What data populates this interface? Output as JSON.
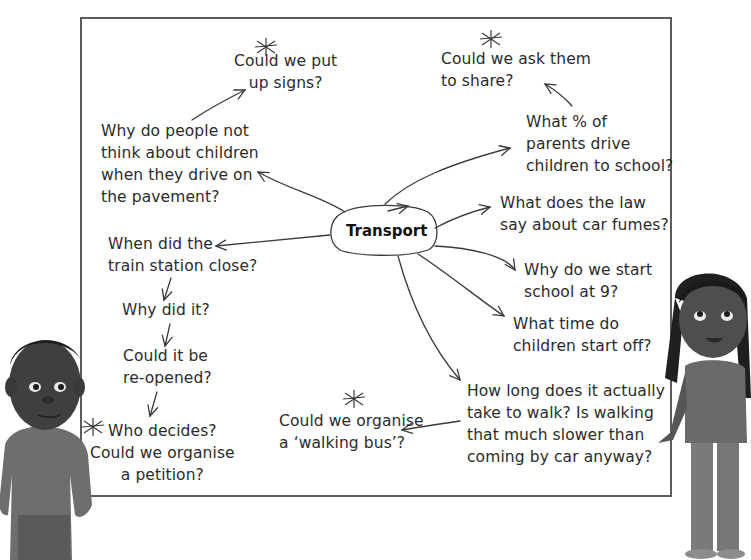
{
  "diagram": {
    "type": "mind-map",
    "central_topic": "Transport",
    "nodes": [
      {
        "id": "signs",
        "text": "Could we put\nup signs?",
        "starred": true
      },
      {
        "id": "share",
        "text": "Could we ask them\nto share?",
        "starred": true
      },
      {
        "id": "pavement",
        "text": "Why do people not\nthink about children\nwhen they drive on\nthe pavement?",
        "starred": false
      },
      {
        "id": "percent",
        "text": "What % of\nparents drive\nchildren to school?",
        "starred": false
      },
      {
        "id": "law",
        "text": "What does the law\nsay about car fumes?",
        "starred": false
      },
      {
        "id": "train",
        "text": "When did the\ntrain station close?",
        "starred": false
      },
      {
        "id": "why_did",
        "text": "Why did it?",
        "starred": false
      },
      {
        "id": "reopen",
        "text": "Could it be\nre-opened?",
        "starred": false
      },
      {
        "id": "decides",
        "text": "Who decides?\nCould we organise\na petition?",
        "starred": true
      },
      {
        "id": "start9",
        "text": "Why do we start\nschool at 9?",
        "starred": false
      },
      {
        "id": "start_off",
        "text": "What time do\nchildren start off?",
        "starred": false
      },
      {
        "id": "walk",
        "text": "How long does it actually\ntake to walk? Is walking\nthat much slower than\ncoming by car anyway?",
        "starred": false
      },
      {
        "id": "walking_bus",
        "text": "Could we organise\na ‘walking bus’?",
        "starred": true
      }
    ],
    "edges": [
      [
        "Transport",
        "pavement"
      ],
      [
        "pavement",
        "signs"
      ],
      [
        "Transport",
        "percent"
      ],
      [
        "percent",
        "share"
      ],
      [
        "Transport",
        "law"
      ],
      [
        "Transport",
        "train"
      ],
      [
        "train",
        "why_did"
      ],
      [
        "why_did",
        "reopen"
      ],
      [
        "reopen",
        "decides"
      ],
      [
        "Transport",
        "start9"
      ],
      [
        "Transport",
        "start_off"
      ],
      [
        "Transport",
        "walk"
      ],
      [
        "walk",
        "walking_bus"
      ]
    ]
  },
  "illustrations": {
    "left": "boy-character",
    "right": "girl-character"
  },
  "colors": {
    "border": "#5c5c5c",
    "text": "#2b2b2b",
    "background": "#ffffff"
  }
}
